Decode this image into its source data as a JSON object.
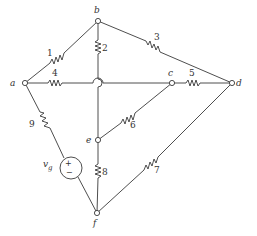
{
  "diagram": {
    "type": "circuit",
    "nodes": [
      {
        "id": "a",
        "label": "a",
        "x": 25,
        "y": 83
      },
      {
        "id": "b",
        "label": "b",
        "x": 98,
        "y": 21
      },
      {
        "id": "c",
        "label": "c",
        "x": 172,
        "y": 83
      },
      {
        "id": "d",
        "label": "d",
        "x": 232,
        "y": 83
      },
      {
        "id": "e",
        "label": "e",
        "x": 98,
        "y": 140
      },
      {
        "id": "f",
        "label": "f",
        "x": 97,
        "y": 213
      }
    ],
    "resistors": [
      {
        "label": "1",
        "from": "a",
        "to": "b"
      },
      {
        "label": "2",
        "from": "b",
        "to": "e"
      },
      {
        "label": "3",
        "from": "b",
        "to": "d"
      },
      {
        "label": "4",
        "from": "a",
        "to": "c"
      },
      {
        "label": "5",
        "from": "c",
        "to": "d"
      },
      {
        "label": "6",
        "from": "e",
        "to": "c"
      },
      {
        "label": "7",
        "from": "f",
        "to": "d"
      },
      {
        "label": "8",
        "from": "e",
        "to": "f"
      },
      {
        "label": "9",
        "from": "a",
        "to": "vg"
      }
    ],
    "source": {
      "label": "v",
      "subscript": "g",
      "plus": "+",
      "minus": "−",
      "from": "a",
      "to": "f"
    },
    "crossover_note": "wire 4 hops over branch b–e"
  }
}
